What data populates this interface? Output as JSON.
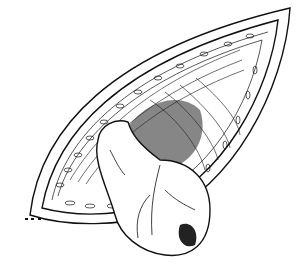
{
  "image": {
    "subject": "surgical anatomical line illustration",
    "width": 298,
    "height": 273,
    "colors": {
      "ink": "#111111",
      "paper": "#ffffff"
    }
  }
}
